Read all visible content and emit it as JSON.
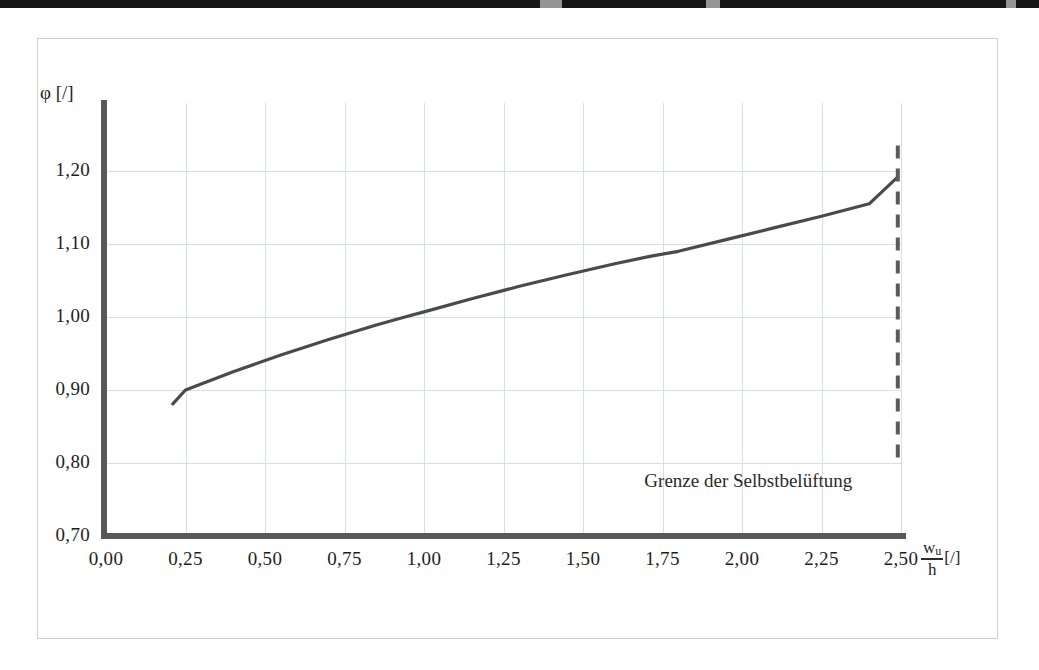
{
  "figure": {
    "y_axis_title": "φ [/]",
    "x_axis_numerator": "w",
    "x_axis_numerator_sub": "u",
    "x_axis_denominator": "h",
    "x_axis_unit": "[/]",
    "annotation": "Grenze der Selbstbelüftung",
    "colors": {
      "axis": "#585858",
      "grid": "#d9dee6",
      "curve": "#4a4a4a",
      "limit_line": "#5a5a5a",
      "frame": "#cfcfcf",
      "text": "#1d1d1d"
    }
  },
  "chart_data": {
    "type": "line",
    "title": "",
    "xlabel": "w_u / h [/]",
    "ylabel": "φ [/]",
    "xlim": [
      0.0,
      2.5
    ],
    "ylim": [
      0.7,
      1.25
    ],
    "xticks": [
      "0,00",
      "0,25",
      "0,50",
      "0,75",
      "1,00",
      "1,25",
      "1,50",
      "1,75",
      "2,00",
      "2,25",
      "2,50"
    ],
    "xtick_values": [
      0.0,
      0.25,
      0.5,
      0.75,
      1.0,
      1.25,
      1.5,
      1.75,
      2.0,
      2.25,
      2.5
    ],
    "yticks": [
      "0,70",
      "0,80",
      "0,90",
      "1,00",
      "1,10",
      "1,20"
    ],
    "ytick_values": [
      0.7,
      0.8,
      0.9,
      1.0,
      1.1,
      1.2
    ],
    "grid": true,
    "legend": "none",
    "series": [
      {
        "name": "φ",
        "x": [
          0.21,
          0.25,
          0.4,
          0.55,
          0.7,
          0.85,
          0.94,
          1.0,
          1.15,
          1.3,
          1.45,
          1.6,
          1.71,
          1.8,
          1.95,
          2.1,
          2.25,
          2.4,
          2.49
        ],
        "y": [
          0.881,
          0.9,
          0.925,
          0.948,
          0.969,
          0.989,
          1.0,
          1.007,
          1.025,
          1.042,
          1.058,
          1.073,
          1.083,
          1.09,
          1.106,
          1.122,
          1.138,
          1.155,
          1.192
        ]
      }
    ],
    "annotations": [
      {
        "text": "Grenze der Selbstbelüftung",
        "x": 2.02,
        "y": 0.772
      }
    ],
    "reference_lines": [
      {
        "orientation": "vertical",
        "x": 2.49,
        "style": "dashed",
        "label": "Grenze der Selbstbelüftung",
        "y_from": 0.795,
        "y_to": 1.235
      }
    ]
  }
}
